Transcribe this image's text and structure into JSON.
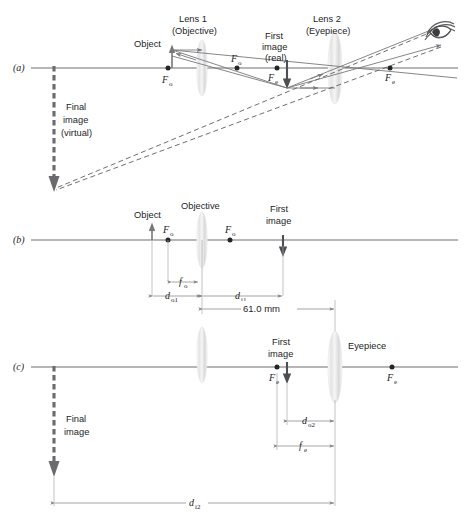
{
  "figure": {
    "panels": [
      {
        "id": "a",
        "label": "(a)",
        "description": "Full ray diagram with objective and eyepiece forming a virtual final image"
      },
      {
        "id": "b",
        "label": "(b)",
        "description": "Objective lens object and image distances"
      },
      {
        "id": "c",
        "label": "(c)",
        "description": "Eyepiece lens object and image distances"
      }
    ]
  },
  "panel_a": {
    "label": "(a)",
    "lens1_title": "Lens 1",
    "lens1_subtitle": "(Objective)",
    "lens2_title": "Lens 2",
    "lens2_subtitle": "(Eyepiece)",
    "object_label": "Object",
    "first_image_line1": "First",
    "first_image_line2": "image",
    "first_image_line3": "(real)",
    "final_image_line1": "Final",
    "final_image_line2": "image",
    "final_image_line3": "(virtual)",
    "focal_obj_left": "F",
    "focal_obj_left_sub": "o",
    "focal_obj_right": "F",
    "focal_obj_right_sub": "o",
    "focal_eye_left": "F",
    "focal_eye_left_sub": "e",
    "focal_eye_right": "F",
    "focal_eye_right_sub": "e",
    "eye_icon": "eye-icon"
  },
  "panel_b": {
    "label": "(b)",
    "object_label": "Object",
    "objective_label": "Objective",
    "first_image_line1": "First",
    "first_image_line2": "image",
    "focal_left": "F",
    "focal_left_sub": "o",
    "focal_right": "F",
    "focal_right_sub": "o",
    "dim_focal": "f",
    "dim_focal_sub": "o",
    "dim_object": "d",
    "dim_object_sub": "o1",
    "dim_image": "d",
    "dim_image_sub": "i1",
    "dim_separation": "61.0 mm"
  },
  "panel_c": {
    "label": "(c)",
    "first_image_line1": "First",
    "first_image_line2": "image",
    "eyepiece_label": "Eyepiece",
    "final_image_line1": "Final",
    "final_image_line2": "image",
    "focal_left": "F",
    "focal_left_sub": "e",
    "focal_right": "F",
    "focal_right_sub": "e",
    "dim_object": "d",
    "dim_object_sub": "o2",
    "dim_focal": "f",
    "dim_focal_sub": "e",
    "dim_image": "d",
    "dim_image_sub": "i2"
  },
  "colors": {
    "axis": "#6f6f70",
    "ray": "#77787b",
    "dashed_ray": "#5d5e61",
    "dimension": "#84858a",
    "dot": "#242527",
    "text": "#232427",
    "lens_fill": "#e9e9ea",
    "background": "#ffffff"
  }
}
